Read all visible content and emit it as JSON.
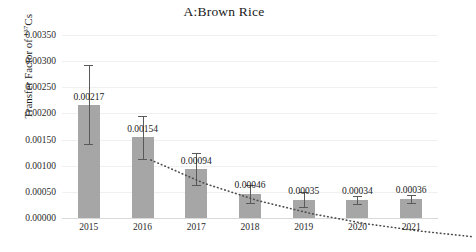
{
  "chart_data": {
    "type": "bar",
    "title": "A:Brown Rice",
    "xlabel": "",
    "ylabel": "Transfer Factor of 137Cs",
    "ylabel_prefix": "Transfer Factor of ",
    "ylabel_superscript": "137",
    "ylabel_suffix": "Cs",
    "categories": [
      "2015",
      "2016",
      "2017",
      "2018",
      "2019",
      "2020",
      "2021"
    ],
    "values": [
      0.00217,
      0.00154,
      0.00094,
      0.00046,
      0.00035,
      0.00034,
      0.00036
    ],
    "value_labels": [
      "0.00217",
      "0.00154",
      "0.00094",
      "0.00046",
      "0.00035",
      "0.00034",
      "0.00036"
    ],
    "errors_upper": [
      0.00075,
      0.00041,
      0.0003,
      0.00018,
      0.00014,
      8e-05,
      8e-05
    ],
    "errors_lower": [
      0.00075,
      0.00041,
      0.0003,
      0.00018,
      0.00014,
      8e-05,
      8e-05
    ],
    "trendline": {
      "style": "dotted",
      "color": "#4d4d4d",
      "values": [
        0.00178,
        0.00133,
        0.001,
        0.00075,
        0.00056,
        0.00042,
        0.00031
      ]
    },
    "ylim": [
      0,
      0.0035
    ],
    "ytick_values": [
      0.0,
      0.0005,
      0.001,
      0.0015,
      0.002,
      0.0025,
      0.003,
      0.0035
    ],
    "ytick_labels": [
      "0.00000",
      "0.00050",
      "0.00100",
      "0.00150",
      "0.00200",
      "0.00250",
      "0.00300",
      "0.00350"
    ],
    "grid": true,
    "legend": "none",
    "bar_color": "#a6a6a6",
    "error_color": "#595959",
    "grid_color": "#f0f0f0",
    "axis_color": "#d9d9d9"
  }
}
